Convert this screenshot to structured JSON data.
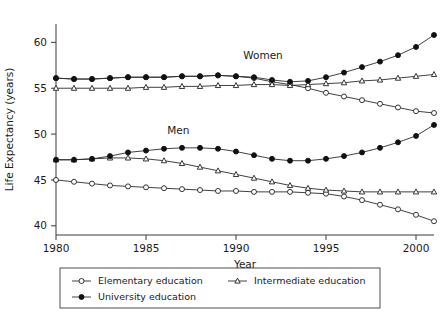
{
  "chart_data": {
    "type": "line",
    "title": "",
    "xlabel": "Year",
    "ylabel": "Life Expectancy (years)",
    "xlim": [
      1980,
      2001
    ],
    "ylim": [
      39,
      62
    ],
    "xticks": [
      1980,
      1985,
      1990,
      1995,
      2000
    ],
    "xticklabels": [
      "1980",
      "1985",
      "1990",
      "1995",
      "2000"
    ],
    "yticks": [
      40,
      45,
      50,
      55,
      60
    ],
    "yticklabels": [
      "40",
      "45",
      "50",
      "55",
      "60"
    ],
    "grid": false,
    "legend_position": "below-axes",
    "annotations": [
      {
        "text": "Women",
        "x": 1991.5,
        "y": 58.2
      },
      {
        "text": "Men",
        "x": 1986.8,
        "y": 50.0
      }
    ],
    "legend": [
      {
        "label": "Elementary education",
        "marker": "open-circle"
      },
      {
        "label": "Intermediate education",
        "marker": "open-triangle"
      },
      {
        "label": "University education",
        "marker": "filled-circle"
      }
    ],
    "x": [
      1980,
      1981,
      1982,
      1983,
      1984,
      1985,
      1986,
      1987,
      1988,
      1989,
      1990,
      1991,
      1992,
      1993,
      1994,
      1995,
      1996,
      1997,
      1998,
      1999,
      2000,
      2001
    ],
    "series": [
      {
        "name": "Women - Elementary education",
        "group": "Women",
        "marker": "open-circle",
        "values": [
          56.1,
          56.0,
          56.0,
          56.1,
          56.2,
          56.2,
          56.2,
          56.3,
          56.3,
          56.4,
          56.3,
          56.1,
          55.7,
          55.4,
          55.0,
          54.5,
          54.1,
          53.7,
          53.3,
          52.9,
          52.5,
          52.3
        ]
      },
      {
        "name": "Women - Intermediate education",
        "group": "Women",
        "marker": "open-triangle",
        "values": [
          55.0,
          55.0,
          55.0,
          55.0,
          55.0,
          55.1,
          55.1,
          55.2,
          55.2,
          55.3,
          55.3,
          55.4,
          55.4,
          55.3,
          55.4,
          55.5,
          55.6,
          55.8,
          55.9,
          56.1,
          56.3,
          56.5
        ]
      },
      {
        "name": "Women - University education",
        "group": "Women",
        "marker": "filled-circle",
        "values": [
          56.1,
          56.0,
          56.0,
          56.1,
          56.2,
          56.2,
          56.2,
          56.3,
          56.3,
          56.4,
          56.3,
          56.2,
          55.9,
          55.7,
          55.8,
          56.2,
          56.7,
          57.3,
          57.9,
          58.6,
          59.5,
          60.8
        ]
      },
      {
        "name": "Men - Elementary education",
        "group": "Men",
        "marker": "open-circle",
        "values": [
          45.0,
          44.8,
          44.6,
          44.4,
          44.3,
          44.2,
          44.1,
          44.0,
          43.9,
          43.8,
          43.8,
          43.7,
          43.7,
          43.7,
          43.6,
          43.5,
          43.2,
          42.8,
          42.3,
          41.8,
          41.2,
          40.5
        ]
      },
      {
        "name": "Men - Intermediate education",
        "group": "Men",
        "marker": "open-triangle",
        "values": [
          47.2,
          47.2,
          47.3,
          47.4,
          47.4,
          47.3,
          47.1,
          46.8,
          46.4,
          46.0,
          45.6,
          45.2,
          44.8,
          44.4,
          44.1,
          43.9,
          43.8,
          43.7,
          43.7,
          43.7,
          43.7,
          43.7
        ]
      },
      {
        "name": "Men - University education",
        "group": "Men",
        "marker": "filled-circle",
        "values": [
          47.2,
          47.2,
          47.3,
          47.6,
          48.0,
          48.2,
          48.4,
          48.5,
          48.5,
          48.4,
          48.1,
          47.7,
          47.3,
          47.1,
          47.1,
          47.3,
          47.6,
          48.0,
          48.5,
          49.1,
          49.8,
          51.0
        ]
      }
    ]
  }
}
